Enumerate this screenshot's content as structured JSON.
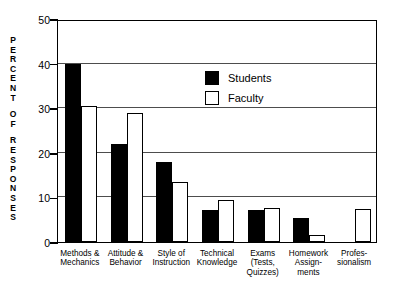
{
  "chart_data": {
    "type": "bar",
    "title": "",
    "subtitle": "",
    "xlabel": "",
    "ylabel": "PERCENT OF RESPONSES",
    "ylabel_lines": [
      "PERCENT",
      "OF",
      "RESPONSES"
    ],
    "ylim": [
      0,
      50
    ],
    "yticks": [
      0,
      10,
      20,
      30,
      40,
      50
    ],
    "ytick_labels": [
      "0",
      "10",
      "20",
      "30",
      "40",
      "50"
    ],
    "grid": "horizontal",
    "legend_position": "inside-top-center",
    "categories": [
      "Methods &\nMechanics",
      "Attitude &\nBehavior",
      "Style of\nInstruction",
      "Technical\nKnowledge",
      "Exams\n(Tests,\nQuizzes)",
      "Homework\nAssign-\nments",
      "Profes-\nsionalism"
    ],
    "series": [
      {
        "name": "Students",
        "color": "#000000",
        "fill": "solid-black",
        "values": [
          40.0,
          22.0,
          18.0,
          7.2,
          7.2,
          5.4,
          0
        ]
      },
      {
        "name": "Faculty",
        "color": "#ffffff",
        "fill": "white-outline",
        "values": [
          30.4,
          29.0,
          13.4,
          9.5,
          7.7,
          1.6,
          7.5
        ]
      }
    ],
    "annotations": []
  },
  "legend": {
    "items": [
      {
        "label": "Students",
        "swatch": "filled-black-square"
      },
      {
        "label": "Faculty",
        "swatch": "outlined-white-square"
      }
    ]
  }
}
